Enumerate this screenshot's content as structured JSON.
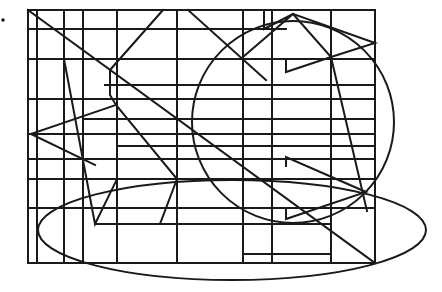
{
  "figure": {
    "type": "geometric-line-figure",
    "stroke_color": "#1a1a1a",
    "background": "#ffffff",
    "rectangle": {
      "x": 28,
      "y": 10,
      "w": 347,
      "h": 253
    },
    "vertical_lines_x": [
      37,
      64,
      83,
      117,
      177,
      243,
      272,
      331
    ],
    "horizontal_lines": [
      {
        "y": 29,
        "x1": 28,
        "x2": 286
      },
      {
        "y": 59,
        "x1": 28,
        "x2": 375
      },
      {
        "y": 85,
        "x1": 105,
        "x2": 375
      },
      {
        "y": 99,
        "x1": 28,
        "x2": 375
      },
      {
        "y": 119,
        "x1": 83,
        "x2": 375
      },
      {
        "y": 134,
        "x1": 28,
        "x2": 375
      },
      {
        "y": 146,
        "x1": 117,
        "x2": 375
      },
      {
        "y": 159,
        "x1": 28,
        "x2": 375
      },
      {
        "y": 179,
        "x1": 28,
        "x2": 375
      },
      {
        "y": 208,
        "x1": 28,
        "x2": 375
      },
      {
        "y": 224,
        "x1": 95,
        "x2": 331
      }
    ],
    "circle": {
      "cx": 293,
      "cy": 122,
      "r": 101
    },
    "ellipse": {
      "cx": 232,
      "cy": 230,
      "rx": 194,
      "ry": 50
    },
    "dot": {
      "cx": 3,
      "cy": 20,
      "r": 1.8
    }
  }
}
